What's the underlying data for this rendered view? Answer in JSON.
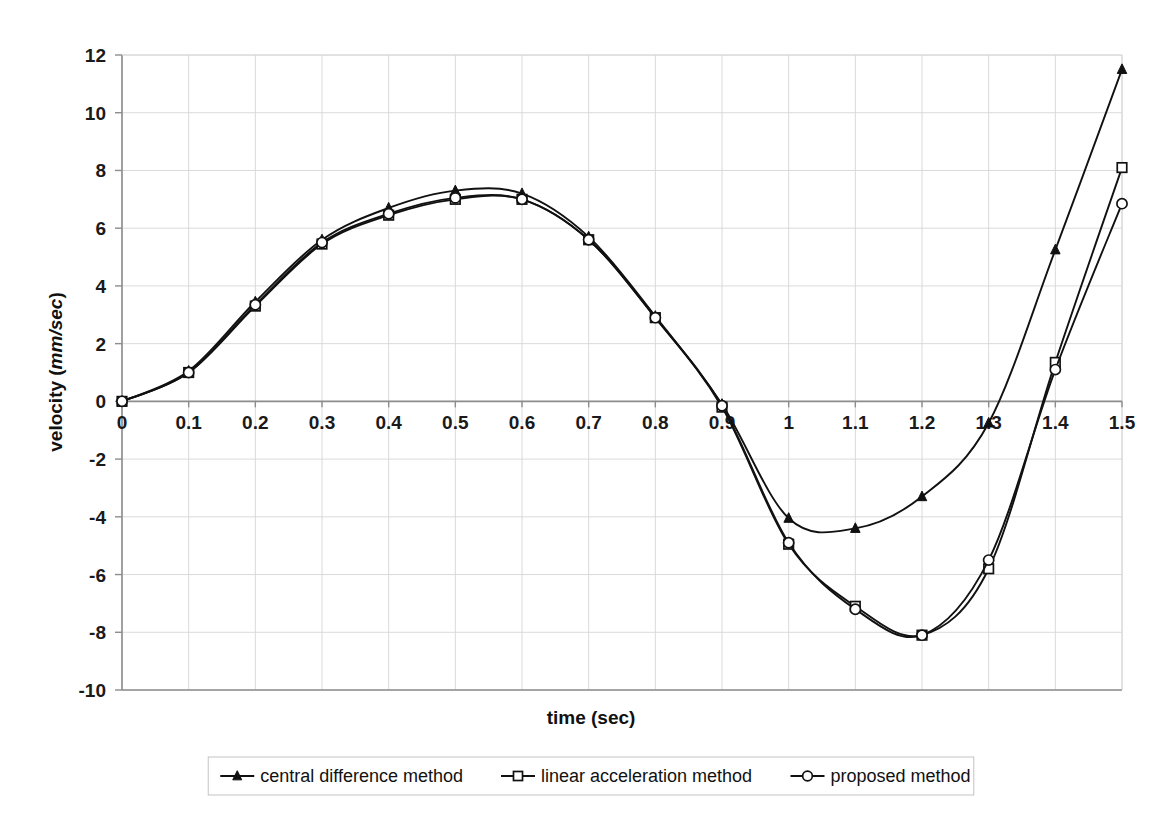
{
  "chart_data": {
    "type": "line",
    "title": "",
    "xlabel": "time (sec)",
    "ylabel_prefix": "velocity (",
    "ylabel_unit": "mm/sec",
    "ylabel_suffix": ")",
    "xlim": [
      0,
      1.5
    ],
    "ylim": [
      -10,
      12
    ],
    "xticks": [
      "0",
      "0.1",
      "0.2",
      "0.3",
      "0.4",
      "0.5",
      "0.6",
      "0.7",
      "0.8",
      "0.9",
      "1",
      "1.1",
      "1.2",
      "1.3",
      "1.4",
      "1.5"
    ],
    "yticks": [
      "12",
      "10",
      "8",
      "6",
      "4",
      "2",
      "0",
      "-2",
      "-4",
      "-6",
      "-8",
      "-10"
    ],
    "grid": true,
    "legend_position": "bottom",
    "x": [
      0,
      0.1,
      0.2,
      0.3,
      0.4,
      0.5,
      0.6,
      0.7,
      0.8,
      0.9,
      1.0,
      1.1,
      1.2,
      1.3,
      1.4,
      1.5
    ],
    "series": [
      {
        "name": "central difference method",
        "marker": "filled-triangle",
        "values": [
          0.0,
          1.05,
          3.45,
          5.6,
          6.7,
          7.3,
          7.2,
          5.7,
          2.95,
          -0.1,
          -4.05,
          -4.4,
          -3.3,
          -0.75,
          5.25,
          11.5
        ]
      },
      {
        "name": "linear acceleration method",
        "marker": "open-square",
        "values": [
          0.0,
          1.0,
          3.3,
          5.45,
          6.45,
          7.0,
          7.0,
          5.6,
          2.9,
          -0.2,
          -4.95,
          -7.1,
          -8.1,
          -5.8,
          1.35,
          8.1
        ]
      },
      {
        "name": "proposed method",
        "marker": "open-circle",
        "values": [
          0.0,
          1.0,
          3.35,
          5.5,
          6.5,
          7.05,
          7.0,
          5.6,
          2.9,
          -0.15,
          -4.9,
          -7.2,
          -8.1,
          -5.5,
          1.1,
          6.85
        ]
      }
    ]
  },
  "legend": {
    "items": [
      {
        "label": "central difference method",
        "marker": "filled-triangle"
      },
      {
        "label": "linear acceleration method",
        "marker": "open-square"
      },
      {
        "label": "proposed method",
        "marker": "open-circle"
      }
    ]
  },
  "axes": {
    "x_title": "time (sec)",
    "y_title_prefix": "velocity (",
    "y_title_unit": "mm/sec",
    "y_title_suffix": ")"
  },
  "colors": {
    "ink": "#111111",
    "grid": "#d6d6d6",
    "axis": "#8d8d8d",
    "background": "#ffffff"
  }
}
